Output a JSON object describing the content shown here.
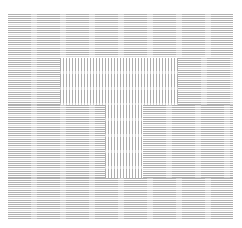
{
  "canvas": {
    "width": 242,
    "height": 228,
    "background_color": "#ffffff"
  },
  "appearance": {
    "ink_color": "#b0b0b0",
    "paper_color": "#ffffff",
    "description": "Document page rendered at extreme zoom-out; glyphs degrade into fine gray rules."
  },
  "content_area": {
    "x": 8,
    "y": 14,
    "width": 225,
    "height": 205
  },
  "regions": [
    {
      "name": "header-text-band",
      "texture": "horizontal-lines",
      "x": 8,
      "y": 14,
      "width": 225,
      "height": 44
    },
    {
      "name": "left-text-column-upper",
      "texture": "horizontal-lines",
      "x": 8,
      "y": 58,
      "width": 52,
      "height": 47
    },
    {
      "name": "table-block-upper",
      "texture": "vertical-columns",
      "x": 60,
      "y": 58,
      "width": 118,
      "height": 47
    },
    {
      "name": "right-text-column-upper",
      "texture": "horizontal-lines",
      "x": 178,
      "y": 58,
      "width": 55,
      "height": 47
    },
    {
      "name": "left-text-column-middle",
      "texture": "horizontal-lines",
      "x": 8,
      "y": 105,
      "width": 97,
      "height": 73
    },
    {
      "name": "table-block-center",
      "texture": "vertical-columns",
      "x": 105,
      "y": 105,
      "width": 38,
      "height": 73
    },
    {
      "name": "right-text-column-middle",
      "texture": "horizontal-lines",
      "x": 143,
      "y": 105,
      "width": 90,
      "height": 73
    },
    {
      "name": "footer-text-band",
      "texture": "horizontal-lines",
      "x": 8,
      "y": 178,
      "width": 225,
      "height": 41
    }
  ]
}
